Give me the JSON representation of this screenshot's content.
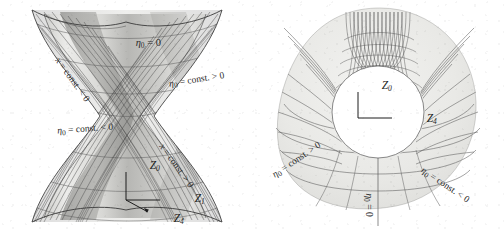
{
  "figure": {
    "background_color": "#ffffff",
    "ink_color": "#2b2b2b",
    "surface_light": "#e8e8e6",
    "surface_mid": "#c9c9c6",
    "surface_dark": "#a6a6a3",
    "panels": [
      {
        "name": "left-panel",
        "kind": "hyperboloid-surface-3d",
        "description": "One-sheeted hyperboloid of revolution rendered in oblique projection with two families of ruling lines"
      },
      {
        "name": "right-panel",
        "kind": "hyperboloid-top-view",
        "description": "Top view of the same hyperboloid: circular throat with radial fans of ruling lines and arcs of constant eta"
      }
    ]
  },
  "left_panel": {
    "labels": {
      "eta_zero": "η₀ = 0",
      "eta_const_pos": "η₀ = const. > 0",
      "eta_const_neg": "η₀ = const. < 0",
      "x_const_neg": "x = const. < 0",
      "x_const_pos": "x = const. > 0"
    },
    "axes": {
      "vertical": "Z₀",
      "horizontal": "Z₁",
      "depth": "Z₄"
    }
  },
  "right_panel": {
    "labels": {
      "eta_const_pos": "η₀ = const. > 0",
      "eta_const_neg": "η₀ = const. < 0",
      "eta_zero": "η₀ = 0"
    },
    "axes": {
      "vertical": "Z₀",
      "horizontal": "Z₄"
    }
  }
}
